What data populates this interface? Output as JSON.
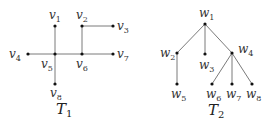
{
  "diagram": {
    "trees": [
      {
        "name": "T",
        "subscript": "1",
        "label_pos": [
          56,
          114
        ],
        "nodes": [
          {
            "id": "v1",
            "base": "v",
            "sub": "1",
            "x": 55,
            "y": 26,
            "lx": 49,
            "ly": 19
          },
          {
            "id": "v2",
            "base": "v",
            "sub": "2",
            "x": 82,
            "y": 26,
            "lx": 76,
            "ly": 19
          },
          {
            "id": "v3",
            "base": "v",
            "sub": "3",
            "x": 113,
            "y": 26,
            "lx": 117,
            "ly": 30
          },
          {
            "id": "v4",
            "base": "v",
            "sub": "4",
            "x": 28,
            "y": 54,
            "lx": 9,
            "ly": 58
          },
          {
            "id": "v5",
            "base": "v",
            "sub": "5",
            "x": 55,
            "y": 54,
            "lx": 41,
            "ly": 68
          },
          {
            "id": "v6",
            "base": "v",
            "sub": "6",
            "x": 82,
            "y": 54,
            "lx": 76,
            "ly": 68
          },
          {
            "id": "v7",
            "base": "v",
            "sub": "7",
            "x": 113,
            "y": 54,
            "lx": 117,
            "ly": 58
          },
          {
            "id": "v8",
            "base": "v",
            "sub": "8",
            "x": 55,
            "y": 84,
            "lx": 50,
            "ly": 97
          }
        ],
        "edges": [
          [
            "v1",
            "v5"
          ],
          [
            "v5",
            "v8"
          ],
          [
            "v4",
            "v5"
          ],
          [
            "v5",
            "v6"
          ],
          [
            "v6",
            "v7"
          ],
          [
            "v2",
            "v6"
          ],
          [
            "v2",
            "v3"
          ]
        ]
      },
      {
        "name": "T",
        "subscript": "2",
        "label_pos": [
          208,
          115
        ],
        "nodes": [
          {
            "id": "w1",
            "base": "w",
            "sub": "1",
            "x": 205,
            "y": 24,
            "lx": 199,
            "ly": 17
          },
          {
            "id": "w2",
            "base": "w",
            "sub": "2",
            "x": 177,
            "y": 53,
            "lx": 160,
            "ly": 57
          },
          {
            "id": "w3",
            "base": "w",
            "sub": "3",
            "x": 205,
            "y": 54,
            "lx": 199,
            "ly": 69
          },
          {
            "id": "w4",
            "base": "w",
            "sub": "4",
            "x": 232,
            "y": 53,
            "lx": 238,
            "ly": 53
          },
          {
            "id": "w5",
            "base": "w",
            "sub": "5",
            "x": 177,
            "y": 84,
            "lx": 171,
            "ly": 98
          },
          {
            "id": "w6",
            "base": "w",
            "sub": "6",
            "x": 212,
            "y": 84,
            "lx": 206,
            "ly": 98
          },
          {
            "id": "w7",
            "base": "w",
            "sub": "7",
            "x": 232,
            "y": 84,
            "lx": 226,
            "ly": 98
          },
          {
            "id": "w8",
            "base": "w",
            "sub": "8",
            "x": 252,
            "y": 84,
            "lx": 246,
            "ly": 98
          }
        ],
        "edges": [
          [
            "w1",
            "w2"
          ],
          [
            "w1",
            "w3"
          ],
          [
            "w1",
            "w4"
          ],
          [
            "w2",
            "w5"
          ],
          [
            "w4",
            "w6"
          ],
          [
            "w4",
            "w7"
          ],
          [
            "w4",
            "w8"
          ]
        ]
      }
    ],
    "colors": {
      "edge": "#7a7a7a",
      "node": "#111111",
      "label": "#333333"
    }
  }
}
